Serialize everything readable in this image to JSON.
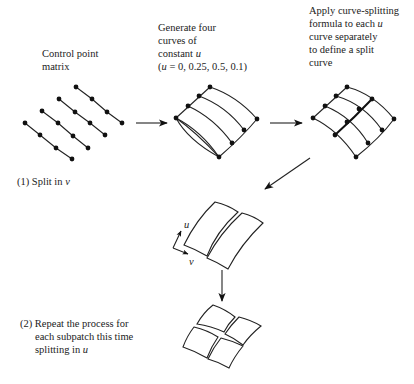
{
  "labels": {
    "control_point": [
      "Control point",
      "matrix"
    ],
    "generate": [
      "Generate four",
      "curves of",
      "constant ",
      "(",
      " = 0, 0.25, 0.5, 0.1)"
    ],
    "generate_var": "u",
    "apply": [
      "Apply curve-splitting",
      "formula to each ",
      "curve separately",
      "to define a split",
      "curve"
    ],
    "apply_var": "u",
    "step1_prefix": "(1) Split in ",
    "step1_var": "v",
    "step2": [
      "(2) Repeat the process for",
      "each subpatch this time",
      "splitting in "
    ],
    "step2_var": "u",
    "axis_u": "u",
    "axis_v": "v"
  },
  "colors": {
    "ink": "#222222",
    "background": "#ffffff"
  }
}
